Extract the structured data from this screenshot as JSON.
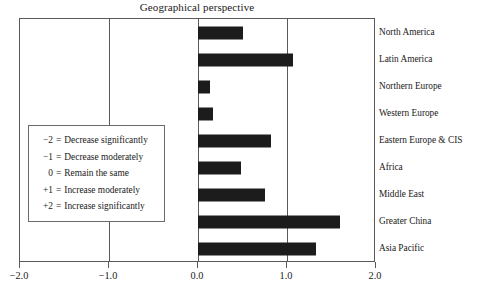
{
  "chart_data": {
    "type": "bar",
    "orientation": "horizontal",
    "title": "Geographical perspective",
    "xlabel": "",
    "ylabel": "",
    "xlim": [
      -2.0,
      2.0
    ],
    "xticks": [
      -2.0,
      -1.0,
      0.0,
      1.0,
      2.0
    ],
    "xtick_labels": [
      "−2.0",
      "−1.0",
      "0.0",
      "1.0",
      "2.0"
    ],
    "grid": true,
    "gridlines_at": [
      -1.0,
      0.0,
      1.0
    ],
    "legend_position": "inside-left",
    "bar_color": "#1c1c1c",
    "categories": [
      "North America",
      "Latin America",
      "Northern Europe",
      "Western Europe",
      "Eastern Europe & CIS",
      "Africa",
      "Middle East",
      "Greater China",
      "Asia Pacific"
    ],
    "values": [
      0.51,
      1.07,
      0.13,
      0.17,
      0.82,
      0.48,
      0.75,
      1.6,
      1.33
    ],
    "legend_entries": [
      {
        "key": "−2",
        "eq": "=",
        "desc": "Decrease significantly"
      },
      {
        "key": "−1",
        "eq": "=",
        "desc": "Decrease moderately"
      },
      {
        "key": "0",
        "eq": "=",
        "desc": "Remain the same"
      },
      {
        "key": "+1",
        "eq": "=",
        "desc": "Increase moderately"
      },
      {
        "key": "+2",
        "eq": "=",
        "desc": "Increase significantly"
      }
    ]
  }
}
